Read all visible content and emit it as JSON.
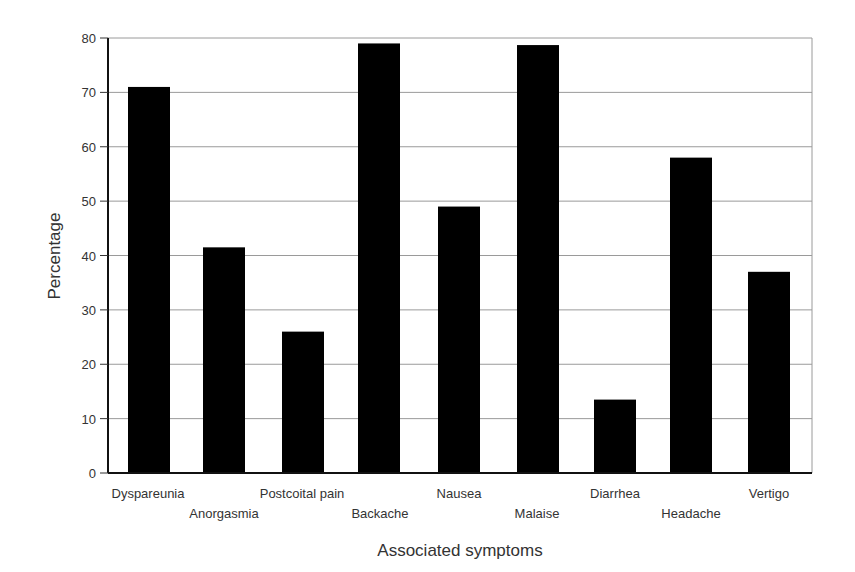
{
  "chart_data": {
    "type": "bar",
    "title": "",
    "xlabel": "Associated symptoms",
    "ylabel": "Percentage",
    "ylim": [
      0,
      80
    ],
    "yticks": [
      0,
      10,
      20,
      30,
      40,
      50,
      60,
      70,
      80
    ],
    "grid": true,
    "legend": null,
    "categories": [
      "Dyspareunia",
      "Anorgasmia",
      "Postcoital pain",
      "Backache",
      "Nausea",
      "Malaise",
      "Diarrhea",
      "Headache",
      "Vertigo"
    ],
    "values": [
      71,
      41.5,
      26,
      79,
      49,
      78.7,
      13.5,
      58,
      37
    ],
    "bar_color": "#000000",
    "grid_color": "#9a9a9a"
  }
}
